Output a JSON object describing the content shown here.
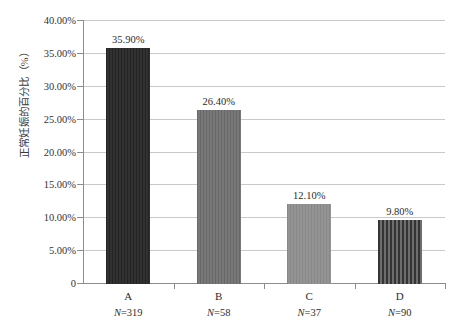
{
  "chart_data": {
    "type": "bar",
    "title": "",
    "xlabel": "",
    "ylabel": "正常妊娠的百分比（%）",
    "categories": [
      "A",
      "B",
      "C",
      "D"
    ],
    "values": [
      35.9,
      26.4,
      12.1,
      9.8
    ],
    "value_labels": [
      "35.90%",
      "26.40%",
      "12.10%",
      "9.80%"
    ],
    "group_sizes": [
      319,
      58,
      37,
      90
    ],
    "group_size_labels": [
      "N=319",
      "N=58",
      "N=37",
      "N=90"
    ],
    "ylim": [
      0,
      40
    ],
    "ytick_values": [
      40,
      35,
      30,
      25,
      20,
      15,
      10,
      5,
      0
    ],
    "ytick_labels": [
      "40.00%",
      "35.00%",
      "30.00%",
      "25.00%",
      "20.00%",
      "15.00%",
      "10.00%",
      "5.00%",
      "0"
    ],
    "grid": "horizontal",
    "legend": "none",
    "bar_colors": [
      "#282828",
      "#6f6f6f",
      "#8d8d8d",
      "#4a4a4a"
    ],
    "gridline_color": "#c9c9c9",
    "axis_color": "#8d8d8d"
  },
  "series": [
    {
      "category": "A",
      "value_label": "35.90%",
      "n_prefix": "N",
      "n_value": "=319",
      "fill": "fill-a"
    },
    {
      "category": "B",
      "value_label": "26.40%",
      "n_prefix": "N",
      "n_value": "=58",
      "fill": "fill-b"
    },
    {
      "category": "C",
      "value_label": "12.10%",
      "n_prefix": "N",
      "n_value": "=37",
      "fill": "fill-c"
    },
    {
      "category": "D",
      "value_label": "9.80%",
      "n_prefix": "N",
      "n_value": "=90",
      "fill": "fill-d"
    }
  ]
}
